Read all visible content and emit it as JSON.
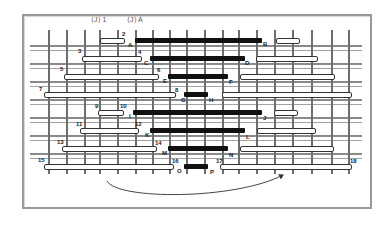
{
  "figure": {
    "headers": [
      {
        "text": "⟨J⟩ 1",
        "x": 91,
        "y": 16
      },
      {
        "text": "⟨J⟩ A",
        "x": 127,
        "y": 16
      }
    ],
    "colors": {
      "frame": "#9a9a9a",
      "post": "#6e6e6e",
      "rail": "#8a8a8a",
      "black_bar": "#111111",
      "white_bar_border": "#333333"
    },
    "posts_x": [
      48,
      66,
      84,
      99,
      117,
      135,
      152,
      169,
      186,
      204,
      222,
      238,
      256,
      274,
      292,
      311,
      331,
      348
    ],
    "rails_y": [
      45,
      50,
      63,
      68,
      81,
      86,
      99,
      104,
      117,
      122,
      135,
      140,
      153,
      158
    ],
    "black_bars": [
      {
        "from": "A",
        "to": "B",
        "y": 38,
        "x1": 135,
        "x2": 262
      },
      {
        "from": "C",
        "to": "D",
        "y": 56,
        "x1": 150,
        "x2": 245
      },
      {
        "from": "E",
        "to": "F",
        "y": 74,
        "x1": 168,
        "x2": 228
      },
      {
        "from": "G",
        "to": "H",
        "y": 92,
        "x1": 184,
        "x2": 208
      },
      {
        "from": "I",
        "to": "J",
        "y": 110,
        "x1": 133,
        "x2": 262
      },
      {
        "from": "K",
        "to": "L",
        "y": 128,
        "x1": 150,
        "x2": 245
      },
      {
        "from": "M",
        "to": "N",
        "y": 146,
        "x1": 168,
        "x2": 228
      },
      {
        "from": "O",
        "to": "P",
        "y": 164,
        "x1": 184,
        "x2": 208
      }
    ],
    "white_bars": [
      {
        "y": 38,
        "x1": 100,
        "x2": 123
      },
      {
        "y": 38,
        "x1": 276,
        "x2": 298
      },
      {
        "y": 56,
        "x1": 82,
        "x2": 140
      },
      {
        "y": 56,
        "x1": 256,
        "x2": 316
      },
      {
        "y": 74,
        "x1": 64,
        "x2": 157
      },
      {
        "y": 74,
        "x1": 240,
        "x2": 333
      },
      {
        "y": 92,
        "x1": 44,
        "x2": 174
      },
      {
        "y": 92,
        "x1": 222,
        "x2": 350
      },
      {
        "y": 110,
        "x1": 98,
        "x2": 122
      },
      {
        "y": 110,
        "x1": 274,
        "x2": 296
      },
      {
        "y": 128,
        "x1": 80,
        "x2": 137
      },
      {
        "y": 128,
        "x1": 257,
        "x2": 314
      },
      {
        "y": 146,
        "x1": 62,
        "x2": 155
      },
      {
        "y": 146,
        "x1": 240,
        "x2": 332
      },
      {
        "y": 164,
        "x1": 44,
        "x2": 172
      },
      {
        "y": 164,
        "x1": 220,
        "x2": 350
      }
    ],
    "labels": [
      {
        "text": "2",
        "x": 122,
        "y": 31
      },
      {
        "text": "A",
        "x": 128,
        "y": 42
      },
      {
        "text": "3",
        "x": 78,
        "y": 48
      },
      {
        "text": "4",
        "x": 138,
        "y": 49
      },
      {
        "text": "B",
        "x": 263,
        "y": 41
      },
      {
        "text": "C",
        "x": 144,
        "y": 60
      },
      {
        "text": "D",
        "x": 245,
        "y": 60
      },
      {
        "text": "5",
        "x": 60,
        "y": 66
      },
      {
        "text": "6",
        "x": 157,
        "y": 67
      },
      {
        "text": "E",
        "x": 163,
        "y": 78
      },
      {
        "text": "F",
        "x": 229,
        "y": 79
      },
      {
        "text": "7",
        "x": 39,
        "y": 86
      },
      {
        "text": "8",
        "x": 175,
        "y": 87
      },
      {
        "text": "G",
        "x": 181,
        "y": 97
      },
      {
        "text": "H",
        "x": 209,
        "y": 97
      },
      {
        "text": "9",
        "x": 95,
        "y": 103
      },
      {
        "text": "10",
        "x": 120,
        "y": 103
      },
      {
        "text": "I",
        "x": 129,
        "y": 113
      },
      {
        "text": "J",
        "x": 263,
        "y": 115
      },
      {
        "text": "11",
        "x": 76,
        "y": 121
      },
      {
        "text": "12",
        "x": 135,
        "y": 121
      },
      {
        "text": "K",
        "x": 145,
        "y": 132
      },
      {
        "text": "L",
        "x": 246,
        "y": 134
      },
      {
        "text": "13",
        "x": 57,
        "y": 139
      },
      {
        "text": "14",
        "x": 155,
        "y": 140
      },
      {
        "text": "M",
        "x": 162,
        "y": 150
      },
      {
        "text": "N",
        "x": 229,
        "y": 152
      },
      {
        "text": "15",
        "x": 38,
        "y": 157
      },
      {
        "text": "16",
        "x": 172,
        "y": 158
      },
      {
        "text": "17",
        "x": 216,
        "y": 158
      },
      {
        "text": "18",
        "x": 350,
        "y": 158
      },
      {
        "text": "O",
        "x": 177,
        "y": 168
      },
      {
        "text": "P",
        "x": 210,
        "y": 169
      }
    ],
    "arrow": {
      "from": [
        107,
        181
      ],
      "to": [
        283,
        175
      ],
      "control_y": 200
    }
  }
}
